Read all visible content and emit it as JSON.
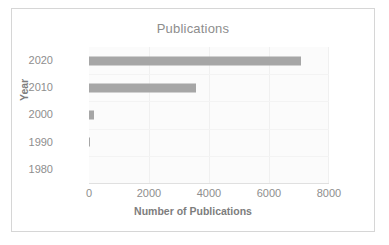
{
  "chart_data": {
    "type": "bar",
    "orientation": "horizontal",
    "title": "Publications",
    "xlabel": "Number of Publications",
    "ylabel": "Year",
    "categories": [
      "2020",
      "2010",
      "2000",
      "1990",
      "1980"
    ],
    "values": [
      7050,
      3560,
      150,
      40,
      0
    ],
    "xlim": [
      0,
      8000
    ],
    "xticks": [
      "0",
      "2000",
      "4000",
      "6000",
      "8000"
    ],
    "xtick_values": [
      0,
      2000,
      4000,
      6000,
      8000
    ],
    "grid": true,
    "legend": "none",
    "colors": {
      "bar": "#a6a6a6",
      "plot_background": "#fbfbfb",
      "text": "#8e8e8e",
      "frame_border": "#d6d6d6"
    }
  }
}
